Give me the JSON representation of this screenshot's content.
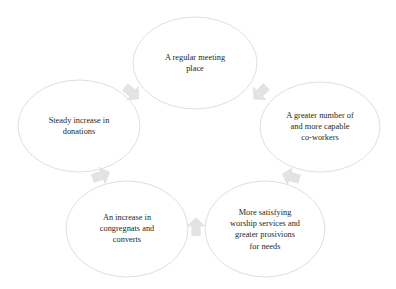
{
  "diagram": {
    "type": "cycle",
    "title": "",
    "background_color": "#ffffff",
    "ellipse_stroke_color": "#d6d6d8",
    "text_color": "#241f20",
    "arrow_color": "#e3e3e5",
    "nodes": [
      {
        "id": "meeting-place",
        "label": "A regular meeting\nplace",
        "cx": 195,
        "cy": 63,
        "rx": 62,
        "ry": 46
      },
      {
        "id": "co-workers",
        "label": "A greater number of\nand more capable\nco-workers",
        "cx": 320,
        "cy": 127,
        "rx": 60,
        "ry": 45
      },
      {
        "id": "worship-services",
        "label": "More satisfying\nworship services and\ngreater prosivions\nfor needs",
        "cx": 265,
        "cy": 229,
        "rx": 60,
        "ry": 48
      },
      {
        "id": "congregants",
        "label": "An increase in\ncongregnats and\nconverts",
        "cx": 127,
        "cy": 229,
        "rx": 61,
        "ry": 48
      },
      {
        "id": "donations",
        "label": "Steady increase in\ndonations",
        "cx": 79,
        "cy": 126,
        "rx": 61,
        "ry": 46
      }
    ],
    "arrows": [
      {
        "id": "arrow-meeting-to-coworkers",
        "from": "meeting-place",
        "to": "co-workers",
        "cx": 261,
        "cy": 92,
        "rotation": 135
      },
      {
        "id": "arrow-coworkers-to-worship",
        "from": "co-workers",
        "to": "worship-services",
        "cx": 292,
        "cy": 177,
        "rotation": 196
      },
      {
        "id": "arrow-worship-to-congregants",
        "from": "worship-services",
        "to": "congregants",
        "cx": 196,
        "cy": 228,
        "rotation": 270
      },
      {
        "id": "arrow-congregants-to-donations",
        "from": "congregants",
        "to": "donations",
        "cx": 100,
        "cy": 176,
        "rotation": 340
      },
      {
        "id": "arrow-donations-to-meeting",
        "from": "donations",
        "to": "meeting-place",
        "cx": 131,
        "cy": 92,
        "rotation": 40
      }
    ]
  }
}
